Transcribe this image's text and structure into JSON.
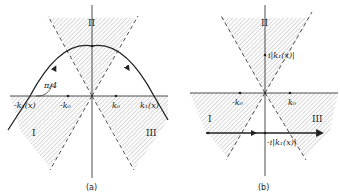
{
  "panel_a": {
    "caption": "(a)",
    "region_labels": {
      "I": "I",
      "II": "II",
      "III": "III"
    },
    "angle_label": "π/4",
    "points": {
      "neg_k1": "-k₁(x)",
      "neg_k0": "-k₀",
      "pos_k0": "k₀",
      "pos_k1": "k₁(x)"
    }
  },
  "panel_b": {
    "caption": "(b)",
    "region_labels": {
      "I": "I",
      "II": "II",
      "III": "III"
    },
    "points": {
      "neg_k0": "-k₀",
      "pos_k0": "k₀",
      "upper": "i|k₁(x)|",
      "lower": "-i|k₁(x)|"
    }
  },
  "colors": {
    "ink": "#222222",
    "hatch": "#9a9a9a"
  }
}
